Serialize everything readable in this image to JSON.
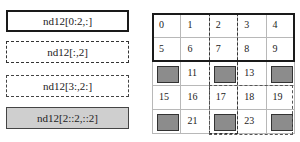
{
  "labels": [
    {
      "text": "nd12[0:2,:]",
      "style": "solid-thick"
    },
    {
      "text": "nd12[:,2]",
      "style": "dash-dot"
    },
    {
      "text": "nd12[3:,2:]",
      "style": "dashed"
    },
    {
      "text": "nd12[2::2,::2]",
      "style": "gray-fill"
    }
  ],
  "grid": {
    "rows": 5,
    "cols": 5,
    "cells": [
      [
        "0",
        "1",
        "2",
        "3",
        "4"
      ],
      [
        "5",
        "6",
        "7",
        "8",
        "9"
      ],
      [
        "",
        "11",
        "",
        "13",
        ""
      ],
      [
        "15",
        "16",
        "17",
        "18",
        "19"
      ],
      [
        "",
        "21",
        "",
        "23",
        ""
      ]
    ],
    "gray_cells": [
      [
        2,
        0
      ],
      [
        2,
        2
      ],
      [
        2,
        4
      ],
      [
        4,
        0
      ],
      [
        4,
        2
      ],
      [
        4,
        4
      ]
    ],
    "gray_color": "#8c8c8c"
  }
}
